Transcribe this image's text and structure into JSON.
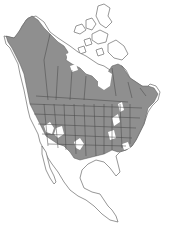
{
  "map": {
    "type": "range-map",
    "region": "North America",
    "colors": {
      "background": "#ffffff",
      "range_fill": "#8f8f8f",
      "land_outline": "#6a6a6a",
      "border_line": "#444444",
      "non_range_land": "#ffffff"
    },
    "layers": [
      {
        "name": "land-outline",
        "description": "Continent coastlines: Alaska, Canada, Arctic islands, USA, Mexico, Central America"
      },
      {
        "name": "range-area",
        "description": "Shaded species range covering Alaska interior, most of Canada south of the Arctic, nearly all contiguous US, extending into northern Mexico"
      },
      {
        "name": "political-borders",
        "description": "State and province boundaries within shaded range"
      },
      {
        "name": "range-gaps",
        "description": "Unshaded holes in the southwest US deserts, Great Lakes region, Atlantic coastal patch, and Hudson Bay area"
      }
    ]
  }
}
